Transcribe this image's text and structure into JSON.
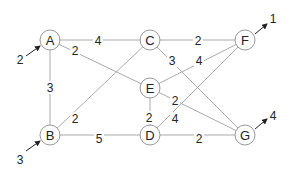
{
  "diagram": {
    "type": "network-flow-graph",
    "nodes": [
      {
        "id": "A",
        "label": "A",
        "x": 50,
        "y": 40
      },
      {
        "id": "C",
        "label": "C",
        "x": 150,
        "y": 40
      },
      {
        "id": "F",
        "label": "F",
        "x": 245,
        "y": 40
      },
      {
        "id": "E",
        "label": "E",
        "x": 150,
        "y": 88
      },
      {
        "id": "B",
        "label": "B",
        "x": 50,
        "y": 135
      },
      {
        "id": "D",
        "label": "D",
        "x": 150,
        "y": 135
      },
      {
        "id": "G",
        "label": "G",
        "x": 245,
        "y": 135
      }
    ],
    "edges": [
      {
        "from": "A",
        "to": "C",
        "weight": "4",
        "lx": 98,
        "ly": 41
      },
      {
        "from": "A",
        "to": "E",
        "weight": "2",
        "lx": 75,
        "ly": 51
      },
      {
        "from": "A",
        "to": "B",
        "weight": "3",
        "lx": 50,
        "ly": 88
      },
      {
        "from": "C",
        "to": "F",
        "weight": "2",
        "lx": 198,
        "ly": 41
      },
      {
        "from": "C",
        "to": "G",
        "weight": "3",
        "lx": 172,
        "ly": 61
      },
      {
        "from": "E",
        "to": "F",
        "weight": "4",
        "lx": 199,
        "ly": 61
      },
      {
        "from": "E",
        "to": "D",
        "weight": "2",
        "lx": 149,
        "ly": 118
      },
      {
        "from": "E",
        "to": "G",
        "weight": "2",
        "lx": 175,
        "ly": 101
      },
      {
        "from": "B",
        "to": "C",
        "weight": "2",
        "lx": 75,
        "ly": 119
      },
      {
        "from": "B",
        "to": "D",
        "weight": "5",
        "lx": 99,
        "ly": 139
      },
      {
        "from": "D",
        "to": "F",
        "weight": "4",
        "lx": 175,
        "ly": 119
      },
      {
        "from": "D",
        "to": "G",
        "weight": "2",
        "lx": 199,
        "ly": 139
      }
    ],
    "external_arrows": [
      {
        "node": "A",
        "direction": "in",
        "value": "2",
        "x1": 26,
        "y1": 56,
        "x2": 40,
        "y2": 46,
        "lx": 20,
        "ly": 64
      },
      {
        "node": "B",
        "direction": "in",
        "value": "3",
        "x1": 26,
        "y1": 151,
        "x2": 40,
        "y2": 141,
        "lx": 20,
        "ly": 164
      },
      {
        "node": "F",
        "direction": "out",
        "value": "1",
        "x1": 255,
        "y1": 34,
        "x2": 267,
        "y2": 24,
        "lx": 273,
        "ly": 23
      },
      {
        "node": "G",
        "direction": "out",
        "value": "4",
        "x1": 255,
        "y1": 129,
        "x2": 267,
        "y2": 119,
        "lx": 273,
        "ly": 120
      }
    ]
  }
}
